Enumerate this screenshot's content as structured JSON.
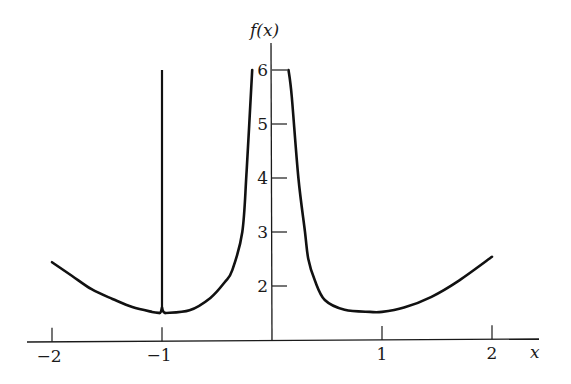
{
  "chart_data": {
    "type": "line",
    "title": "",
    "xlabel": "x",
    "ylabel": "f(x)",
    "xlim": [
      -2.2,
      2.4
    ],
    "ylim": [
      1,
      6.4
    ],
    "grid": false,
    "legend": null,
    "x_ticks": [
      -2,
      -1,
      1,
      2
    ],
    "x_tick_labels": [
      "−2",
      "−1",
      "1",
      "2"
    ],
    "y_ticks": [
      2,
      3,
      4,
      5,
      6
    ],
    "y_tick_labels": [
      "2",
      "3",
      "4",
      "5",
      "6"
    ],
    "series": [
      {
        "name": "left-outer branch",
        "x": [
          -2.0,
          -1.82,
          -1.64,
          -1.45,
          -1.27,
          -1.09,
          -1.02
        ],
        "y": [
          2.44,
          2.19,
          1.94,
          1.76,
          1.61,
          1.52,
          1.5
        ]
      },
      {
        "name": "spike at x=-1",
        "x": [
          -1.0,
          -1.0
        ],
        "y": [
          1.55,
          6.0
        ]
      },
      {
        "name": "left-inner branch",
        "x": [
          -0.97,
          -0.75,
          -0.56,
          -0.43,
          -0.36,
          -0.27,
          -0.23,
          -0.18
        ],
        "y": [
          1.5,
          1.55,
          1.78,
          2.07,
          2.3,
          3.0,
          4.15,
          6.0
        ]
      },
      {
        "name": "right branch",
        "x": [
          0.15,
          0.18,
          0.24,
          0.3,
          0.33,
          0.39,
          0.48,
          0.66,
          0.89,
          1.0,
          1.2,
          1.45,
          1.7,
          2.0
        ],
        "y": [
          6.0,
          5.5,
          4.0,
          3.0,
          2.5,
          2.1,
          1.74,
          1.56,
          1.52,
          1.52,
          1.6,
          1.8,
          2.1,
          2.54
        ]
      }
    ],
    "annotations": []
  },
  "labels": {
    "y_axis_title": "f(x)",
    "x_axis_title": "x"
  },
  "pixel_map": {
    "x0_px": 272,
    "x_unit_px": 110,
    "y1_px": 340,
    "y_unit_px": 54
  }
}
